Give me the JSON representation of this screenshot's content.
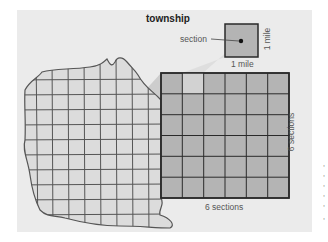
{
  "diagram": {
    "title": "township",
    "section_label": "section",
    "section_width_label": "1 mile",
    "section_height_label": "1 mile",
    "township_width_label": "6 sections",
    "township_height_label": "6 sections",
    "grid": {
      "rows": 6,
      "cols": 6,
      "highlighted_cell": {
        "row": 0,
        "col": 1
      }
    },
    "colors": {
      "panel": "#ebebeb",
      "township_fill": "#b4b4b4",
      "highlight_fill": "#d2d2d2",
      "map_fill": "#dcdcdc",
      "wedge": "#c8c8c8",
      "lines": "#3a3a3a"
    }
  },
  "edge_fragments": [
    ",",
    ",",
    ",",
    ",",
    ",",
    ","
  ]
}
